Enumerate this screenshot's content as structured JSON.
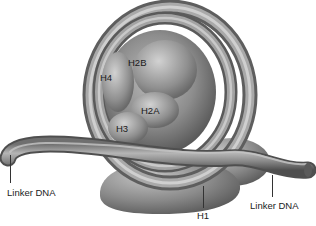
{
  "diagram": {
    "colors": {
      "background": "#ffffff",
      "dna_fill": "#8a8a8a",
      "histone_fill": "#9a9a9a",
      "label_text": "#222222"
    },
    "histone_labels": {
      "h2b": "H2B",
      "h4": "H4",
      "h2a": "H2A",
      "h3": "H3"
    },
    "callouts": {
      "linker_dna_left": "Linker DNA",
      "h1": "H1",
      "linker_dna_right": "Linker DNA"
    }
  }
}
